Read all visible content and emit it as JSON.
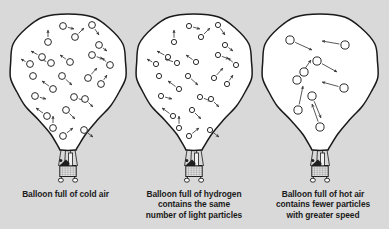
{
  "figure": {
    "background_color": "#d9d9d9",
    "balloon_fill": "#ffffff",
    "outline_color": "#1a1a1a",
    "particle_fill": "#ffffff",
    "particle_stroke": "#2a2a2a",
    "arrow_color": "#3a3a3a",
    "caption_color": "#1b1b1b"
  },
  "captions": {
    "cold": {
      "lines": [
        "Balloon full of cold air"
      ]
    },
    "hydrogen": {
      "lines": [
        "Balloon full of hydrogen",
        "contains the same",
        "number of light particles"
      ]
    },
    "hot": {
      "lines": [
        "Balloon full of hot air",
        "contains fewer particles",
        "with greater speed"
      ]
    }
  },
  "balloons": [
    {
      "id": "cold-air",
      "label": "Balloon full of cold air",
      "center_x": 68,
      "particle_radius": 3.4,
      "particle_count": 24,
      "arrow_speed": "medium",
      "particles": [
        {
          "x": 48,
          "y": 42,
          "ax": 0,
          "ay": -12
        },
        {
          "x": 63,
          "y": 26,
          "ax": 11,
          "ay": 3
        },
        {
          "x": 75,
          "y": 37,
          "ax": 9,
          "ay": -9
        },
        {
          "x": 92,
          "y": 25,
          "ax": 7,
          "ay": 10
        },
        {
          "x": 99,
          "y": 45,
          "ax": 8,
          "ay": 6
        },
        {
          "x": 92,
          "y": 55,
          "ax": 11,
          "ay": 4
        },
        {
          "x": 110,
          "y": 65,
          "ax": -8,
          "ay": -7
        },
        {
          "x": 42,
          "y": 57,
          "ax": -11,
          "ay": -6
        },
        {
          "x": 30,
          "y": 64,
          "ax": -9,
          "ay": -5
        },
        {
          "x": 51,
          "y": 63,
          "ax": -12,
          "ay": -4
        },
        {
          "x": 70,
          "y": 62,
          "ax": -10,
          "ay": -7
        },
        {
          "x": 62,
          "y": 76,
          "ax": 10,
          "ay": 9
        },
        {
          "x": 33,
          "y": 76,
          "ax": 0,
          "ay": 0
        },
        {
          "x": 88,
          "y": 78,
          "ax": 9,
          "ay": -10
        },
        {
          "x": 101,
          "y": 84,
          "ax": 6,
          "ay": -9
        },
        {
          "x": 53,
          "y": 89,
          "ax": -11,
          "ay": -8
        },
        {
          "x": 35,
          "y": 96,
          "ax": 11,
          "ay": 3
        },
        {
          "x": 74,
          "y": 97,
          "ax": 11,
          "ay": 4
        },
        {
          "x": 85,
          "y": 99,
          "ax": 8,
          "ay": 8
        },
        {
          "x": 66,
          "y": 110,
          "ax": 9,
          "ay": 9
        },
        {
          "x": 47,
          "y": 116,
          "ax": -11,
          "ay": -8
        },
        {
          "x": 53,
          "y": 128,
          "ax": 0,
          "ay": -12
        },
        {
          "x": 63,
          "y": 136,
          "ax": 10,
          "ay": -8
        },
        {
          "x": 84,
          "y": 130,
          "ax": 9,
          "ay": 7
        }
      ]
    },
    {
      "id": "hydrogen",
      "label": "Balloon full of hydrogen",
      "center_x": 194,
      "particle_radius": 2.6,
      "particle_count": 24,
      "arrow_speed": "medium",
      "particles": [
        {
          "x": 174,
          "y": 42,
          "ax": 0,
          "ay": -12
        },
        {
          "x": 189,
          "y": 26,
          "ax": 11,
          "ay": 3
        },
        {
          "x": 201,
          "y": 37,
          "ax": 9,
          "ay": -9
        },
        {
          "x": 218,
          "y": 25,
          "ax": 7,
          "ay": 10
        },
        {
          "x": 225,
          "y": 45,
          "ax": 8,
          "ay": 6
        },
        {
          "x": 218,
          "y": 55,
          "ax": 11,
          "ay": 4
        },
        {
          "x": 236,
          "y": 65,
          "ax": -8,
          "ay": -7
        },
        {
          "x": 168,
          "y": 57,
          "ax": -11,
          "ay": -6
        },
        {
          "x": 156,
          "y": 64,
          "ax": -9,
          "ay": -5
        },
        {
          "x": 177,
          "y": 63,
          "ax": -12,
          "ay": -4
        },
        {
          "x": 196,
          "y": 62,
          "ax": -10,
          "ay": -7
        },
        {
          "x": 188,
          "y": 76,
          "ax": 10,
          "ay": 9
        },
        {
          "x": 159,
          "y": 76,
          "ax": 0,
          "ay": 0
        },
        {
          "x": 214,
          "y": 78,
          "ax": 9,
          "ay": -10
        },
        {
          "x": 227,
          "y": 84,
          "ax": 6,
          "ay": -9
        },
        {
          "x": 179,
          "y": 89,
          "ax": -11,
          "ay": -8
        },
        {
          "x": 161,
          "y": 96,
          "ax": 11,
          "ay": 3
        },
        {
          "x": 200,
          "y": 97,
          "ax": 11,
          "ay": 4
        },
        {
          "x": 211,
          "y": 99,
          "ax": 8,
          "ay": 8
        },
        {
          "x": 192,
          "y": 110,
          "ax": 9,
          "ay": 9
        },
        {
          "x": 173,
          "y": 116,
          "ax": -11,
          "ay": -8
        },
        {
          "x": 179,
          "y": 128,
          "ax": 0,
          "ay": -12
        },
        {
          "x": 189,
          "y": 136,
          "ax": 10,
          "ay": -8
        },
        {
          "x": 210,
          "y": 130,
          "ax": 9,
          "ay": 7
        }
      ]
    },
    {
      "id": "hot-air",
      "label": "Balloon full of hot air",
      "center_x": 320,
      "particle_radius": 4.1,
      "particle_count": 9,
      "arrow_speed": "fast",
      "particles": [
        {
          "x": 290,
          "y": 40,
          "ax": 22,
          "ay": 10
        },
        {
          "x": 345,
          "y": 45,
          "ax": -23,
          "ay": -4
        },
        {
          "x": 317,
          "y": 61,
          "ax": 20,
          "ay": 11
        },
        {
          "x": 297,
          "y": 80,
          "ax": 14,
          "ay": -20
        },
        {
          "x": 304,
          "y": 72,
          "ax": 0,
          "ay": 0
        },
        {
          "x": 344,
          "y": 88,
          "ax": -22,
          "ay": -6
        },
        {
          "x": 298,
          "y": 110,
          "ax": 5,
          "ay": -24
        },
        {
          "x": 320,
          "y": 127,
          "ax": -8,
          "ay": -23
        },
        {
          "x": 312,
          "y": 96,
          "ax": 9,
          "ay": 22
        }
      ]
    }
  ]
}
